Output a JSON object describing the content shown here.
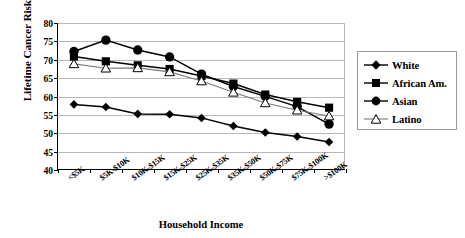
{
  "chart_data": {
    "type": "line",
    "title": "",
    "xlabel": "Household Income",
    "ylabel": "Lifetime Cancer Risk per 100,000",
    "categories": [
      "<$5K",
      "$5K-$10K",
      "$10K-$15K",
      "$15K-$25K",
      "$25K-$35K",
      "$35K-$50K",
      "$50K-$75K",
      "$75K-$100K",
      ">$100K"
    ],
    "ylim": [
      40,
      80
    ],
    "yticks": [
      40,
      45,
      50,
      55,
      60,
      65,
      70,
      75,
      80
    ],
    "ytick_labels": [
      "40",
      "45",
      "50",
      "55",
      "60",
      "65",
      "70",
      "75",
      "80"
    ],
    "grid": true,
    "legend_position": "right",
    "series": [
      {
        "name": "White",
        "marker": "filled-diamond",
        "color": "#000000",
        "values": [
          57.7,
          57.0,
          55.1,
          55.0,
          54.0,
          51.8,
          50.0,
          48.9,
          47.4
        ]
      },
      {
        "name": "African Am.",
        "marker": "filled-square",
        "color": "#000000",
        "values": [
          70.8,
          69.5,
          68.4,
          67.4,
          65.5,
          63.4,
          60.4,
          58.4,
          56.8
        ]
      },
      {
        "name": "Asian",
        "marker": "filled-circle",
        "color": "#000000",
        "values": [
          72.2,
          75.3,
          72.6,
          70.7,
          66.0,
          62.6,
          59.9,
          57.1,
          52.3
        ]
      },
      {
        "name": "Latino",
        "marker": "open-triangle",
        "color": "#000000",
        "values": [
          68.8,
          67.6,
          67.7,
          66.6,
          64.1,
          61.0,
          58.1,
          56.1,
          54.5
        ]
      }
    ]
  },
  "legend": {
    "entries": [
      {
        "label": "White"
      },
      {
        "label": "African Am."
      },
      {
        "label": "Asian"
      },
      {
        "label": "Latino"
      }
    ]
  }
}
